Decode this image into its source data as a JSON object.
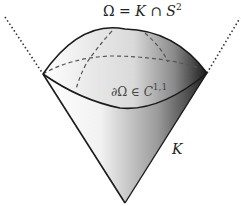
{
  "labels": {
    "omega_def": {
      "omega": "Ω",
      "eq": " = ",
      "K": "K",
      "cap": " ∩ ",
      "S": "S",
      "exp": "2"
    },
    "boundary": {
      "partial": "∂Ω ∈ ",
      "C": "C",
      "exp": "1,1"
    },
    "cone": "K"
  },
  "colors": {
    "stroke": "#1a1a1a",
    "dashed": "#555555",
    "shade_light": "#ffffff",
    "shade_dark": "#1e1e1e"
  }
}
